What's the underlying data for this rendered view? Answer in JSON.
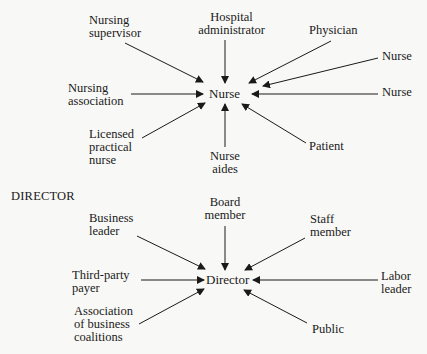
{
  "diagrams": [
    {
      "id": "nurse",
      "heading": "",
      "center": "Nurse",
      "nodes": [
        {
          "label": "Nursing\nsupervisor",
          "direction": "from upper-left"
        },
        {
          "label": "Hospital\nadministrator",
          "direction": "from top"
        },
        {
          "label": "Physician",
          "direction": "from upper-right"
        },
        {
          "label": "Nurse",
          "direction": "from right (upper)"
        },
        {
          "label": "Nursing\nassociation",
          "direction": "from left"
        },
        {
          "label": "Nurse",
          "direction": "from right"
        },
        {
          "label": "Licensed\npractical\nnurse",
          "direction": "from lower-left"
        },
        {
          "label": "Nurse\naides",
          "direction": "from bottom"
        },
        {
          "label": "Patient",
          "direction": "from lower-right"
        }
      ]
    },
    {
      "id": "director",
      "heading": "DIRECTOR",
      "center": "Director",
      "nodes": [
        {
          "label": "Business\nleader",
          "direction": "from upper-left"
        },
        {
          "label": "Board\nmember",
          "direction": "from top"
        },
        {
          "label": "Staff\nmember",
          "direction": "from upper-right"
        },
        {
          "label": "Third-party\npayer",
          "direction": "from left"
        },
        {
          "label": "Labor\nleader",
          "direction": "from right"
        },
        {
          "label": "Association\nof business\ncoalitions",
          "direction": "from lower-left"
        },
        {
          "label": "Public",
          "direction": "from lower-right"
        }
      ]
    }
  ],
  "colors": {
    "ink": "#1a1a1a",
    "paper": "#f8f8f6"
  }
}
